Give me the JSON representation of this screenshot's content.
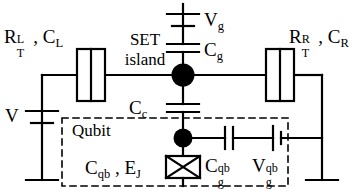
{
  "figure": {
    "type": "circuit-diagram",
    "background_color": "#ffffff",
    "line_color": "#000000",
    "node_color": "#000000"
  },
  "labels": {
    "left_junction": {
      "resistance": "R",
      "res_sup": "L",
      "res_sub": "T",
      "comma": " , ",
      "capacitance": "C",
      "cap_sub": "L"
    },
    "right_junction": {
      "resistance": "R",
      "res_sup": "R",
      "res_sub": "T",
      "comma": " , ",
      "capacitance": "C",
      "cap_sub": "R"
    },
    "set_island_line1": "SET",
    "set_island_line2": "island",
    "gate_voltage": {
      "base": "V",
      "sub": "g"
    },
    "gate_capacitance": {
      "base": "C",
      "sub": "g"
    },
    "coupling_capacitance": {
      "base": "C",
      "sub": "c"
    },
    "bias_voltage": {
      "base": "V"
    },
    "qubit_box_title": "Qubit",
    "qubit_params": {
      "cap": "C",
      "cap_sub": "qb",
      "comma": " , ",
      "ej": "E",
      "ej_sub": "J"
    },
    "qubit_gate_capacitance": {
      "base": "C",
      "sup": "qb",
      "sub": "g"
    },
    "qubit_gate_voltage": {
      "base": "V",
      "sup": "qb",
      "sub": "g"
    }
  },
  "components": [
    {
      "name": "left-tunnel-junction",
      "kind": "tunnel-junction",
      "label_ref": "left_junction"
    },
    {
      "name": "right-tunnel-junction",
      "kind": "tunnel-junction",
      "label_ref": "right_junction"
    },
    {
      "name": "set-island-node",
      "kind": "node"
    },
    {
      "name": "qubit-island-node",
      "kind": "node"
    },
    {
      "name": "gate-capacitor",
      "kind": "capacitor",
      "label_ref": "gate_capacitance"
    },
    {
      "name": "gate-voltage-source",
      "kind": "battery",
      "label_ref": "gate_voltage"
    },
    {
      "name": "coupling-capacitor",
      "kind": "capacitor",
      "label_ref": "coupling_capacitance"
    },
    {
      "name": "bias-voltage-source",
      "kind": "battery",
      "label_ref": "bias_voltage"
    },
    {
      "name": "josephson-junction",
      "kind": "josephson-junction",
      "label_ref": "qubit_params"
    },
    {
      "name": "qubit-gate-capacitor",
      "kind": "capacitor",
      "label_ref": "qubit_gate_capacitance"
    },
    {
      "name": "qubit-gate-voltage-source",
      "kind": "battery",
      "label_ref": "qubit_gate_voltage"
    },
    {
      "name": "qubit-boundary-box",
      "kind": "dashed-rect",
      "label_ref": "qubit_box_title"
    }
  ]
}
